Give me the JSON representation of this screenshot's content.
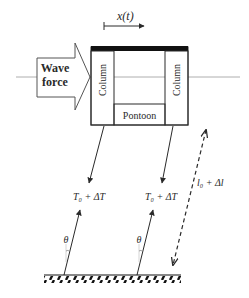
{
  "diagram": {
    "type": "mooring-platform-schematic",
    "colors": {
      "stroke": "#2a2a2a",
      "waterline": "#9a9a9a",
      "deck": "#111111",
      "background": "#ffffff"
    },
    "labels": {
      "displacement": "x(t)",
      "wave_force_line1": "Wave",
      "wave_force_line2": "force",
      "left_column": "Column",
      "right_column": "Column",
      "pontoon": "Pontoon",
      "tension_left": "T₀ + ΔT",
      "tension_right": "T₀ + ΔT",
      "angle_left": "θ",
      "angle_right": "θ",
      "line_length": "l₀ + Δl"
    },
    "components": [
      "waterline",
      "wave-force-arrow",
      "displacement-arrow",
      "platform-deck",
      "left-column",
      "right-column",
      "pontoon",
      "left-mooring-line",
      "right-mooring-line",
      "seabed",
      "line-length-dimension"
    ]
  }
}
